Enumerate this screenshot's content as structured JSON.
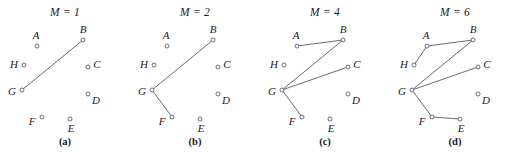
{
  "figure": {
    "edge_color": "#5a5a62",
    "node_stroke_color": "#55555d",
    "node_fill_color": "#ffffff",
    "background_color": "#ffffff",
    "text_color": "#1a1a1a"
  },
  "nodes": [
    {
      "id": "A",
      "label": "A",
      "x": 37,
      "y": 22,
      "label_dx": -1,
      "label_dy": -11
    },
    {
      "id": "B",
      "label": "B",
      "x": 83,
      "y": 16,
      "label_dx": 0,
      "label_dy": -11
    },
    {
      "id": "C",
      "label": "C",
      "x": 88,
      "y": 43,
      "label_dx": 9,
      "label_dy": -3
    },
    {
      "id": "D",
      "label": "D",
      "x": 88,
      "y": 70,
      "label_dx": 8,
      "label_dy": 6
    },
    {
      "id": "E",
      "label": "E",
      "x": 70,
      "y": 95,
      "label_dx": 1,
      "label_dy": 9
    },
    {
      "id": "F",
      "label": "F",
      "x": 42,
      "y": 93,
      "label_dx": -10,
      "label_dy": 4
    },
    {
      "id": "G",
      "label": "G",
      "x": 22,
      "y": 66,
      "label_dx": -10,
      "label_dy": 1
    },
    {
      "id": "H",
      "label": "H",
      "x": 24,
      "y": 41,
      "label_dx": -10,
      "label_dy": -1
    }
  ],
  "panels": [
    {
      "key": "a",
      "title": "M = 1",
      "caption": "(a)",
      "edge_count": 1,
      "edges": [
        [
          "G",
          "B"
        ]
      ]
    },
    {
      "key": "b",
      "title": "M = 2",
      "caption": "(b)",
      "edge_count": 2,
      "edges": [
        [
          "G",
          "B"
        ],
        [
          "G",
          "F"
        ]
      ]
    },
    {
      "key": "c",
      "title": "M = 4",
      "caption": "(c)",
      "edge_count": 4,
      "edges": [
        [
          "G",
          "B"
        ],
        [
          "G",
          "F"
        ],
        [
          "G",
          "C"
        ],
        [
          "A",
          "B"
        ]
      ]
    },
    {
      "key": "d",
      "title": "M = 6",
      "caption": "(d)",
      "edge_count": 6,
      "edges": [
        [
          "G",
          "B"
        ],
        [
          "G",
          "F"
        ],
        [
          "G",
          "C"
        ],
        [
          "A",
          "B"
        ],
        [
          "H",
          "A"
        ],
        [
          "F",
          "E"
        ]
      ]
    }
  ]
}
